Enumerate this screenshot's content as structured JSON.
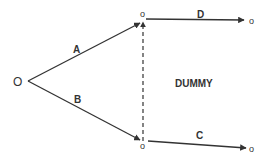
{
  "diagram": {
    "type": "network-activity-diagram",
    "colors": {
      "line": "#333333",
      "text": "#333333",
      "background": "#ffffff"
    },
    "nodes": {
      "start": {
        "label": "O",
        "x": 19,
        "y": 85
      },
      "mid_top": {
        "label": "o",
        "x": 143,
        "y": 18
      },
      "mid_bottom": {
        "label": "o",
        "x": 143,
        "y": 149
      },
      "end_top": {
        "label": "o",
        "x": 253,
        "y": 24
      },
      "end_bottom": {
        "label": "o",
        "x": 253,
        "y": 152
      }
    },
    "edges": {
      "A": {
        "label": "A",
        "style": "solid"
      },
      "B": {
        "label": "B",
        "style": "solid"
      },
      "C": {
        "label": "C",
        "style": "solid"
      },
      "D": {
        "label": "D",
        "style": "solid"
      },
      "dummy": {
        "label": "DUMMY",
        "style": "dashed"
      }
    }
  }
}
